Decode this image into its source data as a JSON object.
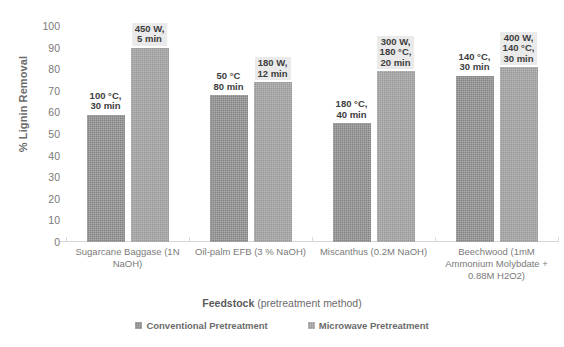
{
  "chart_data": {
    "type": "bar",
    "title": "",
    "xlabel_bold": "Feedstock",
    "xlabel_rest": " (pretreatment method)",
    "ylabel": "% Lignin Removal",
    "ylim": [
      0,
      100
    ],
    "ytick_step": 10,
    "yticks": [
      "100",
      "90",
      "80",
      "70",
      "60",
      "50",
      "40",
      "30",
      "20",
      "10",
      "0"
    ],
    "grid": false,
    "legend_position": "bottom",
    "categories": [
      "Sugarcane Baggase (1N NaOH)",
      "Oil-palm EFB (3 % NaOH)",
      "Miscanthus (0.2M NaOH)",
      "Beechwood (1mM Ammonium Molybdate + 0.88M H2O2)"
    ],
    "series": [
      {
        "name": "Conventional Pretreatment",
        "color": "#858585",
        "values": [
          59,
          68,
          55,
          77
        ],
        "point_labels": [
          "100 °C,\n30 min",
          "50 °C\n80 min",
          "180 °C,\n40 min",
          "140 °C,\n30 min"
        ],
        "label_boxed": [
          false,
          false,
          false,
          false
        ]
      },
      {
        "name": "Microwave Pretreatment",
        "color": "#999999",
        "values": [
          90,
          74,
          79,
          81
        ],
        "point_labels": [
          "450 W,\n5 min",
          "180 W,\n12 min",
          "300 W,\n180 °C,\n20 min",
          "400 W,\n140 °C,\n30 min"
        ],
        "label_boxed": [
          true,
          true,
          true,
          true
        ]
      }
    ]
  },
  "legend": {
    "items": [
      {
        "label": "Conventional Pretreatment",
        "swatch": "conventional"
      },
      {
        "label": "Microwave Pretreatment",
        "swatch": "microwave"
      }
    ]
  }
}
